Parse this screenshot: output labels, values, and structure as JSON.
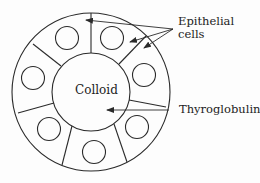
{
  "diagram": {
    "labels": {
      "center": "Colloid",
      "epithelial_line1": "Epithelial",
      "epithelial_line2": "cells",
      "thyroglobulin": "Thyroglobulin"
    },
    "colors": {
      "stroke": "#2a2a2a",
      "background": "#fdfdfd"
    },
    "structure": {
      "outer_circle": {
        "cx": 91,
        "cy": 92,
        "r": 79
      },
      "inner_circle": {
        "cx": 91,
        "cy": 92,
        "r": 39
      },
      "cell_count": 8,
      "nucleus_radius": 11.5
    }
  }
}
